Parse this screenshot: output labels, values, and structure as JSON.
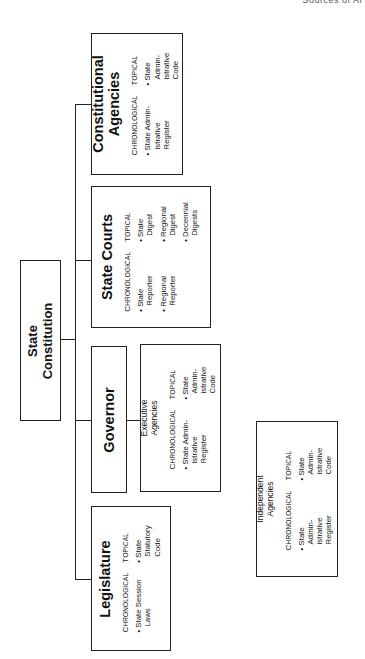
{
  "page": {
    "header_fragment": "Sources of Ar"
  },
  "diagram": {
    "orientation": "rotated -90deg (reads bottom-to-top)",
    "root": {
      "title": "State\nConstitution"
    },
    "column_headers": {
      "chronological": "Chronological",
      "topical": "Topical"
    },
    "branches": [
      {
        "id": "constitutional-agencies",
        "title": "Constitutional\nAgencies",
        "chronological": [
          "State Admin-\nistrative Register"
        ],
        "topical": [
          "State Admin-\nistrative Code"
        ]
      },
      {
        "id": "state-courts",
        "title": "State Courts",
        "chronological": [
          "State\nReporter",
          "Regional\nReporter"
        ],
        "topical": [
          "State\nDigest",
          "Regional\nDigest",
          "Decennial\nDigests"
        ]
      },
      {
        "id": "governor",
        "title": "Governor",
        "child": {
          "id": "executive-agencies",
          "title": "Executive\nAgencies",
          "chronological": [
            "State Admin-\nistrative Register"
          ],
          "topical": [
            "State Admin-\nistrative Code"
          ]
        }
      },
      {
        "id": "legislature",
        "title": "Legislature",
        "chronological": [
          "State Session\nLaws"
        ],
        "topical": [
          "State Statutory\nCode"
        ]
      }
    ],
    "standalone": {
      "id": "independent-agencies",
      "title": "Independent\nAgencies",
      "chronological": [
        "State\nAdmin-\nistrative Register"
      ],
      "topical": [
        "State\nAdmin-\nistrative Code"
      ]
    }
  }
}
